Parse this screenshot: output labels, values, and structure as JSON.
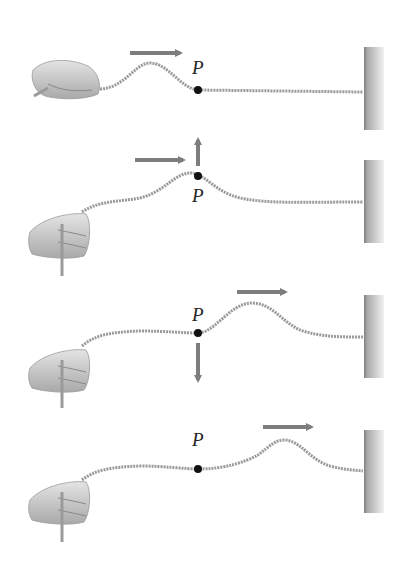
{
  "figure": {
    "colors": {
      "arrow": "#7d7d7d",
      "rope": "#9a9a9a",
      "dot": "#111111",
      "wall_dark": "#8a8a8a",
      "wall_light": "#e6e6e6",
      "hand": "#bdbdbd"
    },
    "panels": [
      {
        "label": "P",
        "pulse_direction": "right",
        "point_velocity": "none",
        "stage": "pulse approaching P"
      },
      {
        "label": "P",
        "pulse_direction": "right",
        "point_velocity": "up",
        "stage": "P at crest"
      },
      {
        "label": "P",
        "pulse_direction": "right",
        "point_velocity": "down",
        "stage": "pulse past P"
      },
      {
        "label": "P",
        "pulse_direction": "right",
        "point_velocity": "none",
        "stage": "pulse near wall"
      }
    ]
  }
}
